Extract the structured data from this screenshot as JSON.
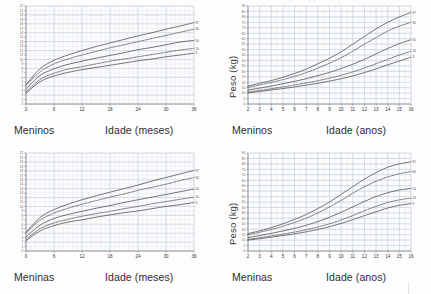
{
  "figure": {
    "background_color": "#fdfdfd",
    "grid_color": "#c3cfdd",
    "grid_minor_color": "#dde4ed",
    "curve_color": "#4a4a4a",
    "axis_color": "#8a8a8a",
    "text_color": "#2d2d2d"
  },
  "panels": [
    {
      "id": "boys-months",
      "sex_label": "Meninos",
      "x_title": "Idade (meses)",
      "y_title": "",
      "y_title_visible": false
    },
    {
      "id": "boys-years",
      "sex_label": "Meninos",
      "x_title": "Idade (anos)",
      "y_title": "Peso (kg)",
      "y_title_visible": true
    },
    {
      "id": "girls-months",
      "sex_label": "Meninas",
      "x_title": "Idade (meses)",
      "y_title": "",
      "y_title_visible": false
    },
    {
      "id": "girls-years",
      "sex_label": "Meninas",
      "x_title": "Idade (anos)",
      "y_title": "Peso (kg)",
      "y_title_visible": true
    }
  ],
  "chart_data": [
    {
      "id": "boys-months",
      "type": "line",
      "title": "",
      "xlabel": "Idade (meses)",
      "ylabel": "Peso (kg)",
      "group_label": "Meninos",
      "grid": true,
      "legend_position": "right-end-of-curves",
      "xlim": [
        0,
        36
      ],
      "ylim": [
        0,
        22
      ],
      "xticks": [
        0,
        6,
        12,
        18,
        24,
        30,
        36
      ],
      "xticklabels": [
        "0",
        "6",
        "12",
        "18",
        "24",
        "30",
        "36"
      ],
      "x_minor_step": 1,
      "yticks": [
        0,
        1,
        2,
        3,
        4,
        5,
        6,
        7,
        8,
        9,
        10,
        11,
        12,
        13,
        14,
        15,
        16,
        17,
        18,
        19,
        20,
        21,
        22
      ],
      "yticklabels": [
        "0",
        "1",
        "2",
        "3",
        "4",
        "5",
        "6",
        "7",
        "8",
        "9",
        "10",
        "11",
        "12",
        "13",
        "14",
        "15",
        "16",
        "17",
        "18",
        "19",
        "20",
        "21",
        "22"
      ],
      "x": [
        0,
        3,
        6,
        9,
        12,
        15,
        18,
        21,
        24,
        27,
        30,
        33,
        36
      ],
      "series": [
        {
          "name": "97",
          "label": "97",
          "style": "solid",
          "values": [
            4.4,
            7.9,
            9.8,
            11.0,
            12.0,
            12.9,
            13.7,
            14.5,
            15.3,
            16.0,
            16.8,
            17.5,
            18.3
          ]
        },
        {
          "name": "90",
          "label": "90",
          "style": "dashed",
          "values": [
            4.2,
            7.2,
            9.0,
            10.1,
            11.0,
            11.8,
            12.6,
            13.3,
            14.0,
            14.7,
            15.4,
            16.1,
            16.8
          ]
        },
        {
          "name": "50",
          "label": "50",
          "style": "solid",
          "values": [
            3.3,
            6.4,
            7.9,
            8.9,
            9.6,
            10.3,
            10.9,
            11.5,
            12.2,
            12.7,
            13.3,
            13.9,
            14.3
          ]
        },
        {
          "name": "10",
          "label": "10",
          "style": "dashed",
          "values": [
            2.7,
            5.5,
            6.9,
            7.8,
            8.4,
            9.0,
            9.6,
            10.1,
            10.6,
            11.1,
            11.6,
            12.1,
            12.5
          ]
        },
        {
          "name": "3",
          "label": "3",
          "style": "solid",
          "values": [
            2.4,
            5.0,
            6.3,
            7.1,
            7.7,
            8.2,
            8.7,
            9.2,
            9.7,
            10.1,
            10.6,
            11.0,
            11.4
          ]
        }
      ]
    },
    {
      "id": "boys-years",
      "type": "line",
      "title": "",
      "xlabel": "Idade (anos)",
      "ylabel": "Peso (kg)",
      "group_label": "Meninos",
      "grid": true,
      "legend_position": "right-end-of-curves",
      "xlim": [
        2,
        16
      ],
      "ylim": [
        0,
        90
      ],
      "xticks": [
        2,
        3,
        4,
        5,
        6,
        7,
        8,
        9,
        10,
        11,
        12,
        13,
        14,
        15,
        16
      ],
      "xticklabels": [
        "2",
        "3",
        "4",
        "5",
        "6",
        "7",
        "8",
        "9",
        "10",
        "11",
        "12",
        "13",
        "14",
        "15",
        "16"
      ],
      "x_minor_step": 0.5,
      "yticks": [
        0,
        5,
        10,
        15,
        20,
        25,
        30,
        35,
        40,
        45,
        50,
        55,
        60,
        65,
        70,
        75,
        80,
        85,
        90
      ],
      "yticklabels": [
        "0",
        "5",
        "10",
        "15",
        "20",
        "25",
        "30",
        "35",
        "40",
        "45",
        "50",
        "55",
        "60",
        "65",
        "70",
        "75",
        "80",
        "85",
        "90"
      ],
      "x": [
        2,
        3,
        4,
        5,
        6,
        7,
        8,
        9,
        10,
        11,
        12,
        13,
        14,
        15,
        16
      ],
      "series": [
        {
          "name": "97",
          "label": "97",
          "style": "solid",
          "values": [
            16.5,
            19.0,
            21.5,
            24.5,
            28.0,
            32.0,
            37.0,
            42.0,
            48.0,
            55.0,
            62.0,
            69.0,
            75.0,
            80.0,
            84.0
          ]
        },
        {
          "name": "90",
          "label": "90",
          "style": "dashed",
          "values": [
            15.3,
            17.5,
            19.8,
            22.4,
            25.3,
            28.8,
            33.0,
            37.5,
            42.5,
            48.5,
            55.0,
            61.0,
            67.0,
            71.5,
            75.0
          ]
        },
        {
          "name": "50",
          "label": "50",
          "style": "solid",
          "values": [
            12.8,
            14.6,
            16.5,
            18.6,
            20.8,
            23.2,
            26.0,
            29.0,
            32.5,
            36.5,
            41.0,
            46.0,
            51.0,
            55.5,
            59.0
          ]
        },
        {
          "name": "10",
          "label": "10",
          "style": "dashed",
          "values": [
            11.0,
            12.5,
            14.0,
            15.7,
            17.5,
            19.3,
            21.4,
            23.7,
            26.4,
            29.5,
            33.0,
            37.0,
            41.0,
            45.0,
            48.5
          ]
        },
        {
          "name": "3",
          "label": "3",
          "style": "solid",
          "values": [
            10.2,
            11.5,
            12.8,
            14.2,
            15.7,
            17.3,
            19.0,
            21.0,
            23.2,
            25.8,
            28.8,
            32.2,
            36.0,
            39.5,
            43.0
          ]
        }
      ]
    },
    {
      "id": "girls-months",
      "type": "line",
      "title": "",
      "xlabel": "Idade (meses)",
      "ylabel": "Peso (kg)",
      "group_label": "Meninas",
      "grid": true,
      "legend_position": "right-end-of-curves",
      "xlim": [
        0,
        36
      ],
      "ylim": [
        0,
        22
      ],
      "xticks": [
        0,
        6,
        12,
        18,
        24,
        30,
        36
      ],
      "xticklabels": [
        "0",
        "6",
        "12",
        "18",
        "24",
        "30",
        "36"
      ],
      "x_minor_step": 1,
      "yticks": [
        0,
        1,
        2,
        3,
        4,
        5,
        6,
        7,
        8,
        9,
        10,
        11,
        12,
        13,
        14,
        15,
        16,
        17,
        18,
        19,
        20,
        21,
        22
      ],
      "yticklabels": [
        "0",
        "1",
        "2",
        "3",
        "4",
        "5",
        "6",
        "7",
        "8",
        "9",
        "10",
        "11",
        "12",
        "13",
        "14",
        "15",
        "16",
        "17",
        "18",
        "19",
        "20",
        "21",
        "22"
      ],
      "x": [
        0,
        3,
        6,
        9,
        12,
        15,
        18,
        21,
        24,
        27,
        30,
        33,
        36
      ],
      "series": [
        {
          "name": "97",
          "label": "97",
          "style": "solid",
          "values": [
            4.2,
            7.5,
            9.3,
            10.5,
            11.5,
            12.4,
            13.2,
            14.0,
            14.8,
            15.7,
            16.5,
            17.3,
            18.1
          ]
        },
        {
          "name": "90",
          "label": "90",
          "style": "dashed",
          "values": [
            4.0,
            6.9,
            8.5,
            9.6,
            10.5,
            11.3,
            12.1,
            12.8,
            13.6,
            14.3,
            15.0,
            15.8,
            16.5
          ]
        },
        {
          "name": "50",
          "label": "50",
          "style": "solid",
          "values": [
            3.2,
            5.8,
            7.3,
            8.2,
            8.9,
            9.6,
            10.2,
            10.9,
            11.5,
            12.1,
            12.7,
            13.3,
            13.9
          ]
        },
        {
          "name": "10",
          "label": "10",
          "style": "dashed",
          "values": [
            2.6,
            5.0,
            6.3,
            7.1,
            7.8,
            8.4,
            8.9,
            9.5,
            10.0,
            10.6,
            11.1,
            11.6,
            12.1
          ]
        },
        {
          "name": "3",
          "label": "3",
          "style": "solid",
          "values": [
            2.3,
            4.5,
            5.7,
            6.5,
            7.0,
            7.6,
            8.1,
            8.6,
            9.0,
            9.5,
            10.0,
            10.4,
            10.9
          ]
        }
      ]
    },
    {
      "id": "girls-years",
      "type": "line",
      "title": "",
      "xlabel": "Idade (anos)",
      "ylabel": "Peso (kg)",
      "group_label": "Meninas",
      "grid": true,
      "legend_position": "right-end-of-curves",
      "xlim": [
        2,
        16
      ],
      "ylim": [
        0,
        90
      ],
      "xticks": [
        2,
        3,
        4,
        5,
        6,
        7,
        8,
        9,
        10,
        11,
        12,
        13,
        14,
        15,
        16
      ],
      "xticklabels": [
        "2",
        "3",
        "4",
        "5",
        "6",
        "7",
        "8",
        "9",
        "10",
        "11",
        "12",
        "13",
        "14",
        "15",
        "16"
      ],
      "x_minor_step": 0.5,
      "yticks": [
        0,
        5,
        10,
        15,
        20,
        25,
        30,
        35,
        40,
        45,
        50,
        55,
        60,
        65,
        70,
        75,
        80,
        85,
        90
      ],
      "yticklabels": [
        "0",
        "5",
        "10",
        "15",
        "20",
        "25",
        "30",
        "35",
        "40",
        "45",
        "50",
        "55",
        "60",
        "65",
        "70",
        "75",
        "80",
        "85",
        "90"
      ],
      "x": [
        2,
        3,
        4,
        5,
        6,
        7,
        8,
        9,
        10,
        11,
        12,
        13,
        14,
        15,
        16
      ],
      "series": [
        {
          "name": "97",
          "label": "97",
          "style": "solid",
          "values": [
            16.0,
            18.5,
            21.5,
            25.0,
            29.0,
            33.5,
            39.0,
            45.0,
            52.0,
            59.0,
            66.0,
            72.0,
            77.0,
            80.0,
            82.0
          ]
        },
        {
          "name": "90",
          "label": "90",
          "style": "dashed",
          "values": [
            15.0,
            17.2,
            19.8,
            22.8,
            26.2,
            30.2,
            35.0,
            40.5,
            46.5,
            53.0,
            59.0,
            64.0,
            68.0,
            71.0,
            73.0
          ]
        },
        {
          "name": "50",
          "label": "50",
          "style": "solid",
          "values": [
            12.4,
            14.2,
            16.2,
            18.4,
            20.8,
            23.6,
            27.0,
            31.0,
            35.5,
            40.5,
            45.5,
            50.0,
            53.5,
            56.0,
            57.5
          ]
        },
        {
          "name": "10",
          "label": "10",
          "style": "dashed",
          "values": [
            10.8,
            12.2,
            13.8,
            15.5,
            17.4,
            19.5,
            22.0,
            25.0,
            28.5,
            32.5,
            37.0,
            41.0,
            44.5,
            47.0,
            48.5
          ]
        },
        {
          "name": "3",
          "label": "3",
          "style": "solid",
          "values": [
            10.0,
            11.3,
            12.7,
            14.2,
            15.8,
            17.6,
            19.8,
            22.3,
            25.3,
            28.8,
            32.5,
            36.0,
            39.5,
            42.0,
            43.5
          ]
        }
      ]
    }
  ]
}
